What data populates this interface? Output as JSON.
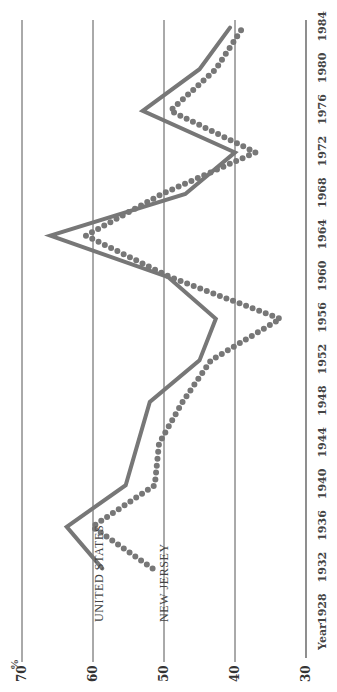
{
  "chart_data": {
    "type": "line",
    "title": "",
    "xlabel": "Year",
    "ylabel": "%",
    "ylim": [
      30,
      70
    ],
    "yticks": [
      30,
      40,
      50,
      60,
      70
    ],
    "xticks": [
      1928,
      1932,
      1936,
      1940,
      1944,
      1948,
      1952,
      1956,
      1960,
      1964,
      1968,
      1972,
      1976,
      1980,
      1984
    ],
    "grid": true,
    "orientation": "rotated-90-ccw",
    "legend_position": "inline-labels-near-start",
    "series": [
      {
        "name": "United States",
        "style": "solid",
        "color": "#777777",
        "x": [
          1932,
          1936,
          1940,
          1948,
          1952,
          1956,
          1960,
          1964,
          1968,
          1972,
          1976,
          1980,
          1984
        ],
        "values": [
          58.7,
          63.7,
          55.4,
          52.0,
          45.0,
          42.7,
          49.4,
          66.0,
          47.0,
          40.0,
          53.0,
          45.0,
          40.7
        ]
      },
      {
        "name": "New Jersey",
        "style": "dotted",
        "color": "#777777",
        "x": [
          1932,
          1936,
          1940,
          1944,
          1948,
          1952,
          1956,
          1960,
          1964,
          1968,
          1972,
          1976,
          1980,
          1984
        ],
        "values": [
          51.6,
          60.1,
          51.3,
          50.7,
          47.4,
          43.4,
          33.6,
          49.1,
          61.0,
          50.3,
          37.1,
          49.1,
          42.7,
          38.9
        ]
      }
    ]
  },
  "labels": {
    "unit": "%",
    "year": "Year",
    "legend_us": "UNITED STATES",
    "legend_nj": "NEW JERSEY"
  }
}
